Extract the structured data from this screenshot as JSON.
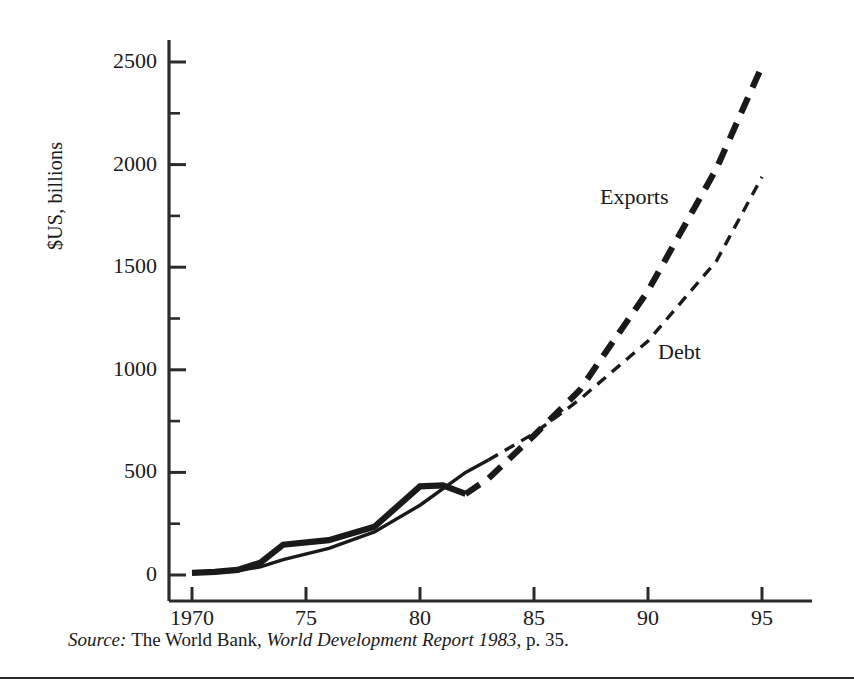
{
  "figure": {
    "ylabel": "$US, billions",
    "source_prefix": "Source:",
    "source_body_1": "The World Bank,",
    "source_title": "World Development Report 1983",
    "source_body_2": ", p. 35."
  },
  "chart_data": {
    "type": "line",
    "title": "",
    "xlabel": "",
    "ylabel": "$US, billions",
    "xlim": [
      1970,
      1995
    ],
    "ylim": [
      0,
      2500
    ],
    "grid": false,
    "legend_position": "inline-annotation",
    "x_ticks": [
      1970,
      1975,
      1980,
      1985,
      1990,
      1995
    ],
    "x_tick_labels": [
      "1970",
      "75",
      "80",
      "85",
      "90",
      "95"
    ],
    "x_minor_ticks": [
      1972.5,
      1977.5,
      1982.5,
      1987.5,
      1992.5
    ],
    "y_ticks": [
      0,
      500,
      1000,
      1500,
      2000,
      2500
    ],
    "y_tick_labels": [
      "0",
      "500",
      "1000",
      "1500",
      "2000",
      "2500"
    ],
    "y_minor_ticks": [
      250,
      750,
      1250,
      1750,
      2250
    ],
    "series": [
      {
        "name": "Exports",
        "style": "thick",
        "solid_until": 1982,
        "x": [
          1970,
          1971,
          1972,
          1973,
          1974,
          1976,
          1978,
          1980,
          1981,
          1982,
          1983,
          1985,
          1987,
          1990,
          1993,
          1995
        ],
        "values": [
          10,
          15,
          25,
          60,
          148,
          170,
          235,
          432,
          437,
          395,
          470,
          680,
          900,
          1385,
          1980,
          2480
        ]
      },
      {
        "name": "Debt",
        "style": "thin",
        "solid_until": 1983,
        "x": [
          1970,
          1971,
          1972,
          1973,
          1974,
          1976,
          1978,
          1980,
          1982,
          1983,
          1985,
          1987,
          1990,
          1993,
          1995
        ],
        "values": [
          8,
          12,
          20,
          40,
          75,
          130,
          210,
          340,
          500,
          560,
          690,
          855,
          1140,
          1530,
          1940
        ]
      }
    ],
    "annotations": [
      {
        "text": "Exports",
        "x": 1991,
        "y": 2130
      },
      {
        "text": "Debt",
        "x": 1992.2,
        "y": 1080
      }
    ],
    "colors": {
      "axis": "#2b2b2b",
      "exports": "#1a1a1a",
      "debt": "#1a1a1a",
      "background": "#ffffff"
    }
  }
}
